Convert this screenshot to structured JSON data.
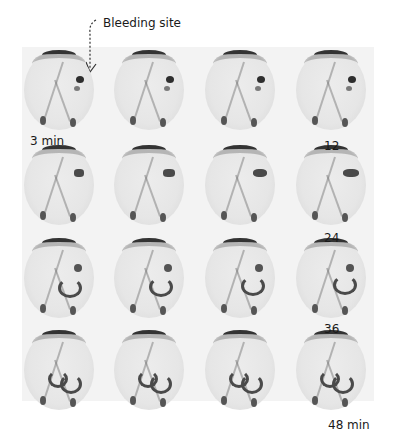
{
  "figure": {
    "annotation": "Bleeding site",
    "grid": {
      "rows": 4,
      "columns": 4
    },
    "time_labels": [
      {
        "text": "3 min",
        "row": 0,
        "col": 0,
        "position": "below"
      },
      {
        "text": "12",
        "row": 0,
        "col": 3,
        "position": "below"
      },
      {
        "text": "24",
        "row": 1,
        "col": 3,
        "position": "below"
      },
      {
        "text": "36",
        "row": 2,
        "col": 3,
        "position": "below"
      },
      {
        "text": "48 min",
        "row": 3,
        "col": 3,
        "position": "below"
      }
    ],
    "colors": {
      "background": "#ffffff",
      "panel": "#f3f3f3",
      "ink": "#1a1a1a"
    }
  }
}
